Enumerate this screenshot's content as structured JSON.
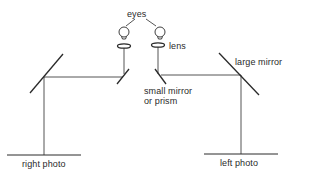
{
  "diagram": {
    "type": "stereoscope-mirror-schematic",
    "colors": {
      "line": "#2a2a2a",
      "text": "#2a2a2a",
      "background": "#ffffff"
    },
    "labels": {
      "eyes": "eyes",
      "lens": "lens",
      "large_mirror": "large mirror",
      "small_mirror_line1": "small mirror",
      "small_mirror_line2": "or prism",
      "right_photo": "right photo",
      "left_photo": "left photo"
    },
    "components": [
      {
        "name": "left-eye",
        "icon": "eye-icon"
      },
      {
        "name": "right-eye",
        "icon": "eye-icon"
      },
      {
        "name": "left-lens",
        "icon": "lens-icon"
      },
      {
        "name": "right-lens",
        "icon": "lens-icon"
      },
      {
        "name": "left-small-mirror",
        "icon": "mirror-icon"
      },
      {
        "name": "right-small-mirror",
        "icon": "mirror-icon"
      },
      {
        "name": "left-large-mirror",
        "icon": "mirror-icon"
      },
      {
        "name": "right-large-mirror",
        "icon": "mirror-icon"
      },
      {
        "name": "right-photo",
        "icon": "photo-plane"
      },
      {
        "name": "left-photo",
        "icon": "photo-plane"
      }
    ]
  }
}
